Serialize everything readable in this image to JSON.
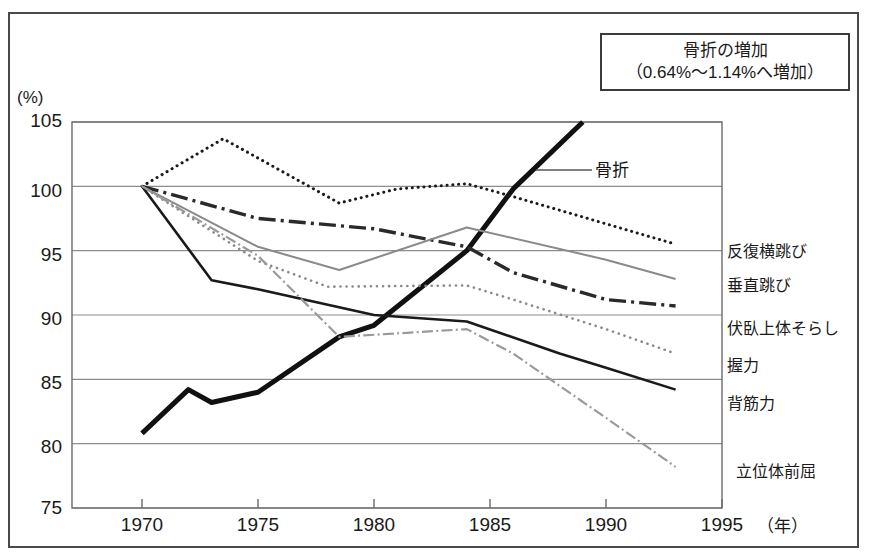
{
  "callout": {
    "line1": "骨折の増加",
    "line2": "（0.64%〜1.14%へ増加）"
  },
  "axes": {
    "y_unit": "(%)",
    "x_unit": "（年）",
    "y_ticks": [
      "105",
      "100",
      "95",
      "90",
      "85",
      "80",
      "75"
    ],
    "x_ticks": [
      "1970",
      "1975",
      "1980",
      "1985",
      "1990",
      "1995"
    ]
  },
  "annotations": {
    "fracture": "骨折"
  },
  "series_labels": {
    "s0": "反復横跳び",
    "s1": "垂直跳び",
    "s2": "伏臥上体そらし",
    "s3": "握力",
    "s4": "背筋力",
    "s5": "立位体前屈"
  },
  "chart_data": {
    "type": "line",
    "xlabel": "（年）",
    "ylabel": "(%)",
    "xlim": [
      1968.5,
      1995.5
    ],
    "ylim": [
      75,
      105
    ],
    "xticks": [
      1970,
      1975,
      1980,
      1985,
      1990,
      1995
    ],
    "yticks": [
      75,
      80,
      85,
      90,
      95,
      100,
      105
    ],
    "grid": "horizontal",
    "legend_position": "right-of-plot (inline end labels)",
    "series": [
      {
        "name": "骨折",
        "label_in_plot": "骨折",
        "style": "solid",
        "color": "#111111",
        "linewidth": 5,
        "x": [
          1970,
          1972,
          1973,
          1975,
          1978.5,
          1980,
          1984,
          1986,
          1989
        ],
        "values": [
          80.8,
          84.2,
          83.2,
          84.0,
          88.3,
          89.2,
          95.0,
          99.8,
          105.0
        ]
      },
      {
        "name": "反復横跳び",
        "style": "dotted",
        "color": "#1a1a1a",
        "linewidth": 3,
        "x": [
          1970,
          1973.5,
          1978.5,
          1981,
          1984,
          1986,
          1993
        ],
        "values": [
          100.0,
          103.7,
          98.7,
          99.8,
          100.2,
          99.2,
          95.5
        ]
      },
      {
        "name": "垂直跳び",
        "style": "dash-dot",
        "color": "#2a2a2a",
        "linewidth": 3.4,
        "x": [
          1970,
          1975,
          1980,
          1984,
          1986,
          1990,
          1993
        ],
        "values": [
          100.0,
          97.5,
          96.7,
          95.3,
          93.3,
          91.2,
          90.7
        ]
      },
      {
        "name": "伏臥上体そらし",
        "style": "dotted",
        "color": "#8a8a8a",
        "linewidth": 2.6,
        "x": [
          1970,
          1975,
          1978,
          1984,
          1986,
          1990,
          1993
        ],
        "values": [
          100.0,
          94.2,
          92.2,
          92.3,
          91.2,
          88.9,
          87.0
        ]
      },
      {
        "name": "握力",
        "style": "solid",
        "color": "#8a8a8a",
        "linewidth": 2,
        "x": [
          1970,
          1975,
          1978.5,
          1984,
          1990,
          1993
        ],
        "values": [
          100.0,
          95.3,
          93.5,
          96.8,
          94.3,
          92.8
        ]
      },
      {
        "name": "背筋力",
        "style": "solid",
        "color": "#1a1a1a",
        "linewidth": 2.6,
        "x": [
          1970,
          1973,
          1975,
          1980,
          1984,
          1988,
          1990,
          1993
        ],
        "values": [
          100.0,
          92.7,
          92.0,
          90.0,
          89.5,
          87.0,
          85.9,
          84.2
        ]
      },
      {
        "name": "立位体前屈",
        "style": "dash-dot",
        "color": "#9a9a9a",
        "linewidth": 2.2,
        "x": [
          1970,
          1975,
          1978.5,
          1984,
          1986,
          1990,
          1993
        ],
        "values": [
          100.0,
          94.6,
          88.3,
          88.9,
          87.0,
          82.0,
          78.2
        ]
      }
    ]
  }
}
